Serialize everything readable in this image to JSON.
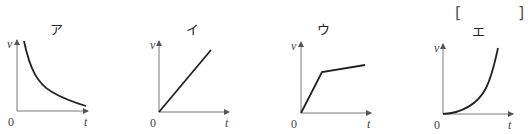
{
  "answer_box": {
    "left": "[",
    "right": "]"
  },
  "graphs": [
    {
      "title": "ア",
      "y_label": "v",
      "x_label": "t",
      "origin": "0",
      "shape": "decreasing-hyperbolic"
    },
    {
      "title": "イ",
      "y_label": "v",
      "x_label": "t",
      "origin": "0",
      "shape": "linear-increasing"
    },
    {
      "title": "ウ",
      "y_label": "v",
      "x_label": "t",
      "origin": "0",
      "shape": "steep-linear-then-gentle-linear"
    },
    {
      "title": "エ",
      "y_label": "v",
      "x_label": "t",
      "origin": "0",
      "shape": "accelerating-increasing"
    }
  ],
  "colors": {
    "curve": "#222222",
    "axis": "#555555"
  }
}
